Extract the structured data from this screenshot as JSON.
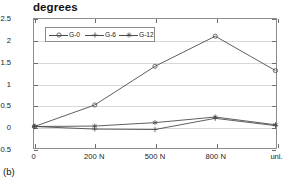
{
  "figure": {
    "caption": "(b)",
    "title": "degrees"
  },
  "chart_data": {
    "type": "line",
    "title": "degrees",
    "xlabel": "",
    "ylabel": "degrees",
    "categories": [
      "0",
      "200 N",
      "500 N",
      "800 N",
      "unl."
    ],
    "ylim": [
      -0.5,
      2.5
    ],
    "yticks": [
      -0.5,
      0,
      0.5,
      1,
      1.5,
      2,
      2.5
    ],
    "ytick_labels": [
      "-0.5",
      "0",
      "0.5",
      "1",
      "1.5",
      "2",
      "2.5"
    ],
    "grid": true,
    "legend_position": "upper left",
    "series": [
      {
        "name": "G-0",
        "marker": "circle-icon",
        "color": "#4a4a4a",
        "values": [
          0.0,
          0.5,
          1.4,
          2.1,
          1.3
        ]
      },
      {
        "name": "G-6",
        "marker": "plus-icon",
        "color": "#4a4a4a",
        "values": [
          0.0,
          -0.06,
          -0.07,
          0.19,
          0.02
        ]
      },
      {
        "name": "G-12",
        "marker": "asterisk-icon",
        "color": "#4a4a4a",
        "values": [
          0.0,
          0.01,
          0.09,
          0.22,
          0.04
        ]
      }
    ]
  },
  "colors": {
    "line": "#4a4a4a",
    "axis": "#8d8d8d",
    "grid": "#d8d8d8",
    "text": "#1a1a1a"
  }
}
